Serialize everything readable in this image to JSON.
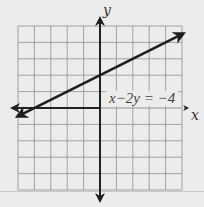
{
  "chart_data": {
    "type": "line",
    "title": "",
    "xlabel": "x",
    "ylabel": "y",
    "xlim": [
      -5,
      5
    ],
    "ylim": [
      -5,
      5
    ],
    "grid": true,
    "grid_step": 1,
    "tick_labels": false,
    "series": [
      {
        "name": "x-2y=-4",
        "equation": "x − 2y = −4",
        "slope": 0.5,
        "y_intercept": 2,
        "x_intercept": -4,
        "points": [
          [
            -5,
            -0.5
          ],
          [
            -4,
            0
          ],
          [
            0,
            2
          ],
          [
            5,
            4.5
          ]
        ],
        "arrows": "both"
      }
    ],
    "annotations": [
      {
        "text": "x−2y = −4",
        "x": 0.5,
        "y": 0.5
      }
    ]
  },
  "labels": {
    "x_axis": "x",
    "y_axis": "y",
    "equation": "x−2y = −4"
  },
  "colors": {
    "background": "#ececec",
    "grid": "#9a9a9a",
    "axis": "#222222",
    "line": "#1e1e1e"
  }
}
